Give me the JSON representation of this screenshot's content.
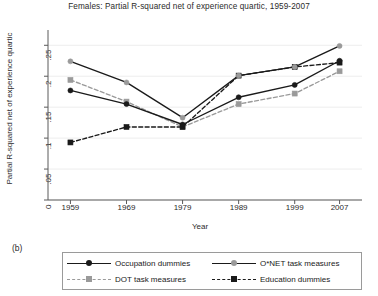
{
  "figure": {
    "panel_label": "(b)",
    "title": "Females: Partial R-squared net of experience quartic, 1959-2007"
  },
  "chart_data": {
    "type": "line",
    "title": "Females: Partial R-squared net of experience quartic, 1959-2007",
    "xlabel": "Year",
    "ylabel": "Partial R-squared net of experience quartic",
    "x": [
      1959,
      1969,
      1979,
      1989,
      1999,
      2007
    ],
    "xtick_labels": [
      "1959",
      "1969",
      "1979",
      "1989",
      "1999",
      "2007"
    ],
    "ytick_values": [
      0,
      0.05,
      0.1,
      0.15,
      0.2,
      0.25
    ],
    "ytick_labels": [
      "0",
      ".05",
      ".1",
      ".15",
      ".2",
      ".25"
    ],
    "xlim": [
      1955,
      2011
    ],
    "ylim": [
      0,
      0.265
    ],
    "grid": "horizontal-light",
    "legend_position": "below-plot",
    "series": [
      {
        "name": "Occupation dummies",
        "values": [
          0.177,
          0.155,
          0.122,
          0.166,
          0.186,
          0.225
        ],
        "color": "#1a1a1a",
        "line_style": "solid",
        "marker": "circle",
        "marker_color": "#1a1a1a"
      },
      {
        "name": "O*NET task measures",
        "values": [
          0.224,
          0.19,
          0.133,
          0.201,
          0.215,
          0.249
        ],
        "color": "#1a1a1a",
        "line_style": "solid",
        "marker": "circle",
        "marker_color": "#9a9a9a"
      },
      {
        "name": "DOT task measures",
        "values": [
          0.194,
          0.159,
          0.118,
          0.155,
          0.172,
          0.208
        ],
        "color": "#9a9a9a",
        "line_style": "dashed",
        "marker": "square",
        "marker_color": "#9a9a9a"
      },
      {
        "name": "Education dummies",
        "values": [
          0.093,
          0.118,
          0.118,
          0.201,
          0.215,
          0.222
        ],
        "color": "#1a1a1a",
        "line_style": "dashed",
        "marker": "square",
        "marker_color": "#1a1a1a"
      }
    ]
  }
}
